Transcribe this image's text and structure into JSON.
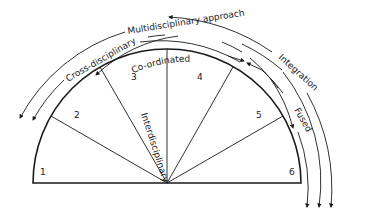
{
  "diagram": {
    "type": "semicircle-spectrum",
    "segments": [
      {
        "number": "1"
      },
      {
        "number": "2"
      },
      {
        "number": "3"
      },
      {
        "number": "4"
      },
      {
        "number": "5"
      },
      {
        "number": "6"
      }
    ],
    "labels": {
      "multidisciplinary": "Multidisciplinary approach",
      "cross_disciplinary": "Cross-disciplinary",
      "co_ordinated": "Co-ordinated",
      "integration": "Integration",
      "fused": "Fused",
      "interdisciplinary": "Interdisciplinary"
    },
    "colors": {
      "line": "#1a1a1a",
      "background": "#ffffff"
    }
  }
}
